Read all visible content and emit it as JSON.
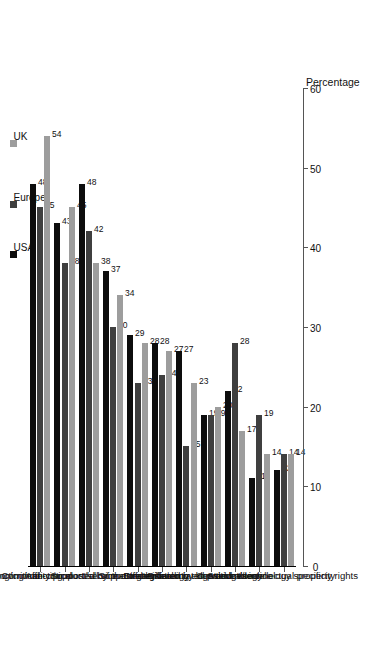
{
  "chart_data": {
    "type": "bar",
    "orientation": "vertical-rotated",
    "title": "",
    "xlabel": "",
    "ylabel": "Percentage",
    "ylim": [
      0,
      60
    ],
    "yticks": [
      0,
      10,
      20,
      30,
      40,
      50,
      60
    ],
    "grid": false,
    "legend_position": "top",
    "categories": [
      "Supporting/critical",
      "Supporting/non-critical",
      "Commodity product/service",
      "Affecting most/all of the organisation",
      "Supported by mature technology",
      "Strategic",
      "Supported by leading edge technology",
      "Differentiated by knowledge/technology specificity",
      "Differentiated product/service",
      "Stand alone",
      "Sensitive to intellectual property rights"
    ],
    "series": [
      {
        "name": "USA",
        "color": "#0d0d0d",
        "values": [
          48,
          43,
          48,
          37,
          29,
          28,
          27,
          19,
          22,
          11,
          12
        ]
      },
      {
        "name": "Europe",
        "color": "#3f3f3f",
        "values": [
          45,
          38,
          42,
          30,
          23,
          24,
          15,
          19,
          28,
          19,
          14
        ]
      },
      {
        "name": "UK",
        "color": "#9d9d9d",
        "values": [
          54,
          45,
          38,
          34,
          28,
          27,
          23,
          20,
          17,
          14,
          14
        ]
      }
    ]
  },
  "legend": {
    "items": [
      {
        "label": "USA",
        "swatch": "usa"
      },
      {
        "label": "Europe",
        "swatch": "europe"
      },
      {
        "label": "UK",
        "swatch": "uk"
      }
    ]
  },
  "axis": {
    "value_axis_title": "Percentage",
    "tick_labels": [
      "0",
      "10",
      "20",
      "30",
      "40",
      "50",
      "60"
    ]
  }
}
